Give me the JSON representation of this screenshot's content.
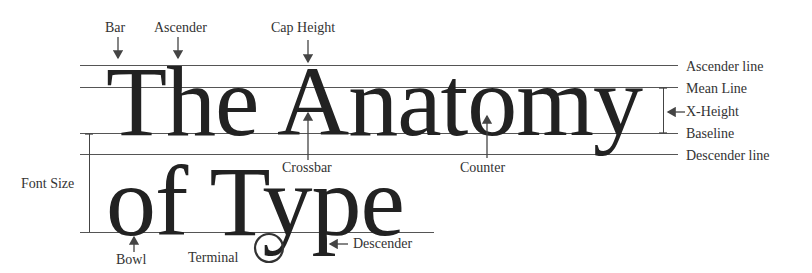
{
  "diagram": {
    "headline_line1": "The Anatomy",
    "headline_line2": "of Type",
    "top_labels": {
      "bar": "Bar",
      "ascender": "Ascender",
      "cap_height": "Cap Height"
    },
    "right_labels": {
      "ascender_line": "Ascender line",
      "mean_line": "Mean Line",
      "x_height": "X-Height",
      "baseline": "Baseline",
      "descender_line": "Descender line"
    },
    "inner_labels": {
      "crossbar": "Crossbar",
      "counter": "Counter"
    },
    "left_labels": {
      "font_size": "Font Size"
    },
    "bottom_labels": {
      "bowl": "Bowl",
      "terminal": "Terminal",
      "descender": "Descender"
    },
    "colors": {
      "background": "#ffffff",
      "text": "#222222",
      "lines": "#555555"
    }
  }
}
